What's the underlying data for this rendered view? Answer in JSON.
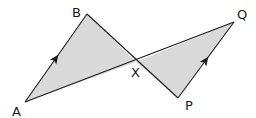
{
  "diagram": {
    "fill_color": "#d9d9d9",
    "stroke_color": "#1a1a1a",
    "points": {
      "A": {
        "label": "A",
        "x": 25,
        "y": 102,
        "lx": 12,
        "ly": 116
      },
      "B": {
        "label": "B",
        "x": 87,
        "y": 14,
        "lx": 72,
        "ly": 17
      },
      "X": {
        "label": "X",
        "x": 136,
        "y": 62,
        "lx": 131,
        "ly": 77
      },
      "P": {
        "label": "P",
        "x": 178,
        "y": 98,
        "lx": 185,
        "ly": 110
      },
      "Q": {
        "label": "Q",
        "x": 234,
        "y": 22,
        "lx": 237,
        "ly": 19
      }
    },
    "triangles": [
      {
        "name": "ABX",
        "vertices": [
          "A",
          "B",
          "X"
        ],
        "shaded": true
      },
      {
        "name": "XPQ",
        "vertices": [
          "X",
          "P",
          "Q"
        ],
        "shaded": true
      }
    ],
    "segments": [
      "AB",
      "BP",
      "AQ",
      "PQ"
    ],
    "parallel_marks": [
      {
        "segment": "AB",
        "x": 56,
        "y": 58,
        "angle": -54
      },
      {
        "segment": "PQ",
        "x": 206,
        "y": 60,
        "angle": -54
      }
    ]
  }
}
